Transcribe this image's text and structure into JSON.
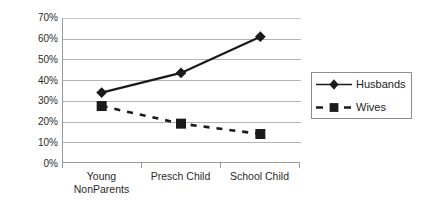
{
  "chart_data": {
    "type": "line",
    "title": "",
    "xlabel": "",
    "ylabel": "",
    "categories": [
      "Young NonParents",
      "Presch Child",
      "School Child"
    ],
    "category_lines": [
      [
        "Young",
        "NonParents"
      ],
      [
        "Presch Child",
        ""
      ],
      [
        "School Child",
        ""
      ]
    ],
    "series": [
      {
        "name": "Husbands",
        "values": [
          34,
          43.5,
          61
        ],
        "marker": "diamond",
        "line_style": "solid",
        "color": "#1a1a1a"
      },
      {
        "name": "Wives",
        "values": [
          27.5,
          19,
          14
        ],
        "marker": "square",
        "line_style": "dashed",
        "color": "#1a1a1a"
      }
    ],
    "ylim": [
      0,
      70
    ],
    "ytick_labels": [
      "70%",
      "60%",
      "50%",
      "40%",
      "30%",
      "20%",
      "10%",
      "0%"
    ],
    "ytick_values": [
      70,
      60,
      50,
      40,
      30,
      20,
      10,
      0
    ],
    "grid": true,
    "grid_axis": "y",
    "legend_position": "right",
    "value_format": "percent"
  },
  "legend": {
    "entries": [
      {
        "label": "Husbands",
        "marker": "diamond-marker",
        "line_style": "solid"
      },
      {
        "label": "Wives",
        "marker": "square-marker",
        "line_style": "dashed"
      }
    ]
  },
  "colors": {
    "series": "#1a1a1a",
    "gridline": "#b5b5b5",
    "axis": "#9a9a9a",
    "text": "#2b2b2b",
    "background": "#ffffff",
    "legend_border": "#8d8d8d"
  }
}
